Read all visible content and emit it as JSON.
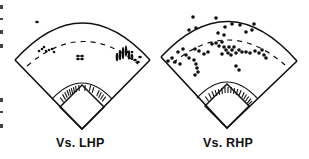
{
  "figure": {
    "type": "spray-chart-pair",
    "panels": [
      {
        "id": "vs-lhp",
        "caption": "Vs. LHP",
        "home": [
          82,
          129
        ],
        "left_corner": [
          15,
          60
        ],
        "right_corner": [
          150,
          60
        ],
        "arc_top_y": 14,
        "hits": [
          [
            37,
            22,
            3,
            2
          ],
          [
            39,
            51,
            2,
            2
          ],
          [
            42,
            49,
            2,
            2
          ],
          [
            44,
            47,
            2,
            2
          ],
          [
            46,
            51,
            2,
            2
          ],
          [
            49,
            50,
            2,
            2
          ],
          [
            52,
            49,
            2,
            2
          ],
          [
            54,
            52,
            2,
            2
          ],
          [
            78,
            56,
            3,
            2
          ],
          [
            82,
            56,
            3,
            2
          ],
          [
            78,
            59,
            3,
            2
          ],
          [
            82,
            59,
            3,
            2
          ],
          [
            117,
            57,
            2,
            8
          ],
          [
            120,
            55,
            2,
            10
          ],
          [
            123,
            53,
            2,
            12
          ],
          [
            126,
            51,
            2,
            11
          ],
          [
            129,
            55,
            2,
            9
          ],
          [
            132,
            57,
            2,
            6
          ],
          [
            135,
            60,
            3,
            2
          ],
          [
            138,
            62,
            3,
            2
          ],
          [
            127,
            52,
            2,
            2
          ],
          [
            132,
            52,
            2,
            2
          ],
          [
            140,
            57,
            3,
            2
          ]
        ],
        "grounders": [
          [
            62,
            100
          ],
          [
            64,
            97
          ],
          [
            66,
            95
          ],
          [
            68,
            93
          ],
          [
            70,
            92
          ],
          [
            72,
            91
          ],
          [
            74,
            90
          ],
          [
            76,
            89
          ],
          [
            79,
            88
          ],
          [
            85,
            88
          ],
          [
            90,
            88
          ],
          [
            93,
            90
          ],
          [
            98,
            93
          ],
          [
            100,
            95
          ],
          [
            102,
            97
          ],
          [
            104,
            99
          ]
        ]
      },
      {
        "id": "vs-rhp",
        "caption": "Vs. RHP",
        "home": [
          227,
          128
        ],
        "left_corner": [
          161,
          57
        ],
        "right_corner": [
          297,
          61
        ],
        "arc_top_y": 12,
        "hits": [
          [
            193,
            17,
            3,
            3
          ],
          [
            216,
            18,
            3,
            3
          ],
          [
            189,
            30,
            3,
            3
          ],
          [
            196,
            28,
            3,
            3
          ],
          [
            225,
            27,
            3,
            3
          ],
          [
            232,
            24,
            3,
            3
          ],
          [
            240,
            25,
            3,
            3
          ],
          [
            246,
            32,
            3,
            3
          ],
          [
            252,
            30,
            3,
            3
          ],
          [
            254,
            24,
            3,
            3
          ],
          [
            218,
            33,
            3,
            3
          ],
          [
            224,
            35,
            3,
            3
          ],
          [
            178,
            52,
            3,
            3
          ],
          [
            183,
            49,
            3,
            3
          ],
          [
            186,
            55,
            3,
            3
          ],
          [
            189,
            58,
            3,
            3
          ],
          [
            195,
            49,
            3,
            3
          ],
          [
            199,
            51,
            3,
            3
          ],
          [
            204,
            54,
            3,
            3
          ],
          [
            208,
            52,
            3,
            3
          ],
          [
            212,
            44,
            3,
            3
          ],
          [
            216,
            43,
            3,
            3
          ],
          [
            219,
            46,
            3,
            3
          ],
          [
            222,
            42,
            3,
            3
          ],
          [
            224,
            47,
            3,
            3
          ],
          [
            226,
            50,
            3,
            3
          ],
          [
            229,
            47,
            3,
            3
          ],
          [
            232,
            50,
            3,
            3
          ],
          [
            234,
            47,
            3,
            3
          ],
          [
            236,
            53,
            3,
            3
          ],
          [
            239,
            50,
            3,
            3
          ],
          [
            242,
            52,
            3,
            3
          ],
          [
            228,
            53,
            3,
            3
          ],
          [
            222,
            54,
            3,
            3
          ],
          [
            231,
            55,
            3,
            3
          ],
          [
            246,
            52,
            3,
            3
          ],
          [
            250,
            53,
            3,
            3
          ],
          [
            255,
            51,
            3,
            3
          ],
          [
            259,
            53,
            3,
            3
          ],
          [
            264,
            55,
            3,
            3
          ],
          [
            266,
            58,
            3,
            3
          ],
          [
            262,
            50,
            3,
            3
          ],
          [
            172,
            58,
            3,
            3
          ],
          [
            168,
            61,
            3,
            3
          ],
          [
            175,
            62,
            3,
            3
          ],
          [
            180,
            64,
            3,
            3
          ],
          [
            194,
            60,
            3,
            3
          ],
          [
            196,
            64,
            3,
            3
          ],
          [
            197,
            68,
            3,
            3
          ],
          [
            198,
            72,
            3,
            3
          ],
          [
            195,
            75,
            3,
            3
          ],
          [
            236,
            66,
            3,
            3
          ],
          [
            239,
            70,
            3,
            3
          ]
        ],
        "grounders": [
          [
            207,
            99
          ],
          [
            210,
            96
          ],
          [
            213,
            94
          ],
          [
            216,
            93
          ],
          [
            219,
            92
          ],
          [
            222,
            91
          ],
          [
            225,
            90
          ],
          [
            228,
            90
          ],
          [
            231,
            90
          ],
          [
            234,
            91
          ],
          [
            237,
            92
          ],
          [
            240,
            93
          ],
          [
            243,
            95
          ],
          [
            245,
            97
          ],
          [
            247,
            99
          ],
          [
            249,
            101
          ],
          [
            250,
            103
          ]
        ]
      }
    ]
  },
  "captions": {
    "left": "Vs. LHP",
    "right": "Vs. RHP"
  }
}
